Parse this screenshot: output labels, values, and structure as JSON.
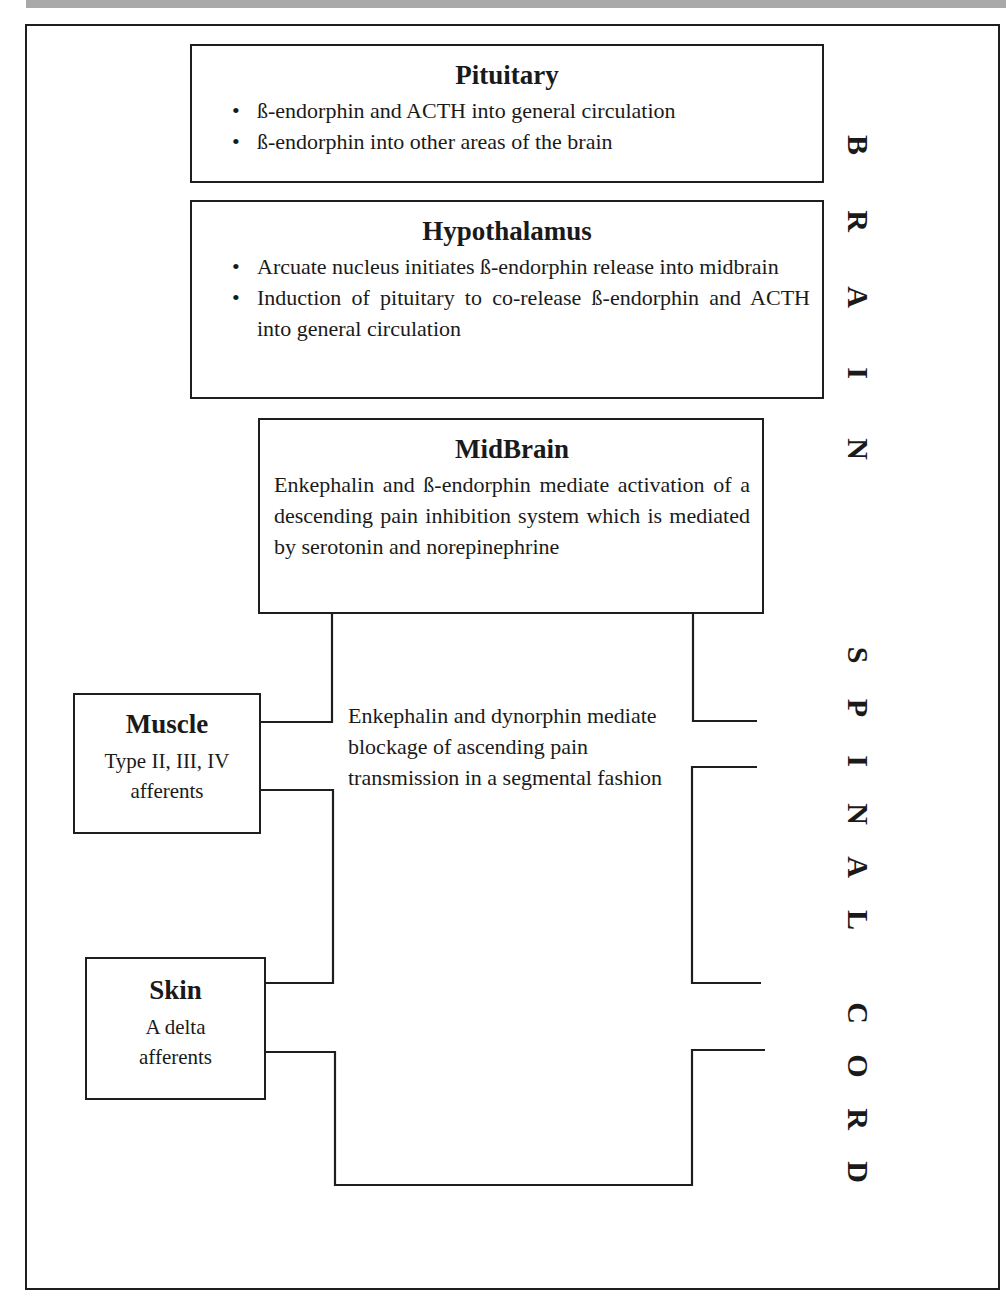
{
  "diagram": {
    "title_vertical_top": "BRAIN",
    "title_vertical_bottom": "SPINAL CORD",
    "colors": {
      "line": "#1e1e1e",
      "text": "#1a1a1a",
      "top_bar": "#a9a9a9",
      "background": "#ffffff"
    },
    "pituitary": {
      "title": "Pituitary",
      "bullets": [
        "ß-endorphin and ACTH into general circulation",
        "ß-endorphin into other areas of the brain"
      ]
    },
    "hypothalamus": {
      "title": "Hypothalamus",
      "bullets": [
        "Arcuate nucleus initiates ß-endorphin release into midbrain",
        "Induction of pituitary to co-release ß-endorphin and ACTH into general circulation"
      ]
    },
    "midbrain": {
      "title": "MidBrain",
      "text": "Enkephalin and ß-endorphin mediate activation of a descending pain inhibition system which is mediated by serotonin and norepinephrine"
    },
    "spinal_segment": {
      "text": "Enkephalin and dynorphin mediate blockage of ascending pain transmission in a segmental fashion"
    },
    "muscle": {
      "title": "Muscle",
      "line1": "Type II, III, IV",
      "line2": "afferents"
    },
    "skin": {
      "title": "Skin",
      "line1": "A delta",
      "line2": "afferents"
    },
    "brain_letters": [
      "B",
      "R",
      "A",
      "I",
      "N"
    ],
    "spinal_letters": [
      "S",
      "P",
      "I",
      "N",
      "A",
      "L",
      "C",
      "O",
      "R",
      "D"
    ]
  }
}
